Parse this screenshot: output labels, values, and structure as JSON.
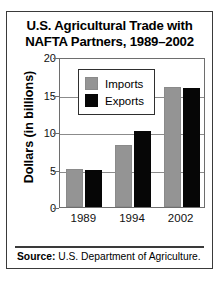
{
  "figure": {
    "title_lines": [
      "U.S. Agricultural Trade with",
      "NAFTA Partners, 1989–2002"
    ],
    "source_label": "Source:",
    "source_text": " U.S. Department of Agriculture.",
    "colors": {
      "imports": "#949494",
      "exports": "#060606",
      "frame": "#3a3a3a",
      "gridline": "#8b8b8b",
      "background": "#ffffff"
    }
  },
  "chart_data": {
    "type": "bar",
    "title": "U.S. Agricultural Trade with NAFTA Partners, 1989–2002",
    "xlabel": "",
    "ylabel": "Dollars (in billions)",
    "categories": [
      "1989",
      "1994",
      "2002"
    ],
    "series": [
      {
        "name": "Imports",
        "color": "#949494",
        "values": [
          5.1,
          8.3,
          16.0
        ]
      },
      {
        "name": "Exports",
        "color": "#060606",
        "values": [
          4.9,
          10.1,
          15.9
        ]
      }
    ],
    "ylim": [
      0,
      20
    ],
    "yticks": [
      0,
      5,
      10,
      15,
      20
    ],
    "ytick_labels": [
      "0",
      "5",
      "10",
      "15",
      "20"
    ],
    "grid": true,
    "legend_position": "upper-left-inside",
    "legend_entries": [
      "Imports",
      "Exports"
    ],
    "source": "Source: U.S. Department of Agriculture."
  }
}
